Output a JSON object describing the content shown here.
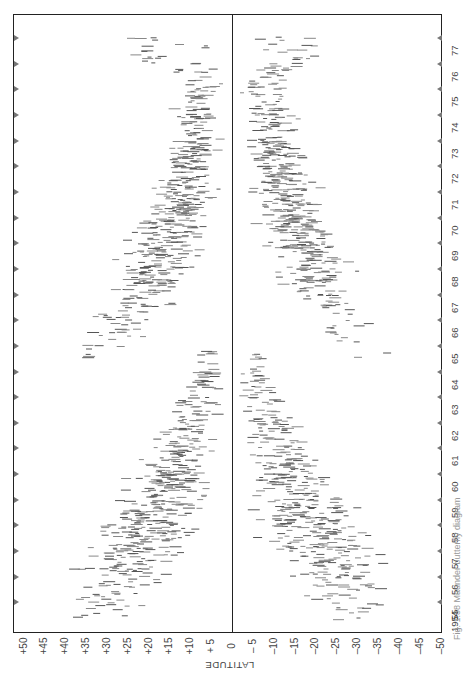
{
  "chart_data": {
    "type": "scatter",
    "title": "",
    "subtitle": "Butterfly diagram of sunspot latitudes (rotated 90°)",
    "xlabel": "LATITUDE",
    "ylabel": "",
    "x_ticks": [
      "+50",
      "+45",
      "+40",
      "+35",
      "+30",
      "+25",
      "+20",
      "+15",
      "+10",
      "+5",
      "0",
      "-5",
      "-10",
      "-15",
      "-20",
      "-25",
      "-30",
      "-35",
      "-40",
      "-45",
      "-50"
    ],
    "x_tick_values": [
      50,
      45,
      40,
      35,
      30,
      25,
      20,
      15,
      10,
      5,
      0,
      -5,
      -10,
      -15,
      -20,
      -25,
      -30,
      -35,
      -40,
      -45,
      -50
    ],
    "xlim": [
      50,
      -50
    ],
    "y_ticks": [
      "1954",
      "55",
      "56",
      "57",
      "58",
      "59",
      "60",
      "61",
      "62",
      "63",
      "64",
      "65",
      "66",
      "67",
      "68",
      "69",
      "70",
      "71",
      "72",
      "73",
      "74",
      "75",
      "76",
      "77"
    ],
    "ylim": [
      1954,
      1977
    ],
    "grid": false,
    "reference_line": {
      "latitude": 0
    },
    "series": [
      {
        "name": "Northern hemisphere (cycle 19)",
        "points": [
          {
            "year": 1954.3,
            "lat_min": 22,
            "lat_max": 40,
            "density": 0.15
          },
          {
            "year": 1955.0,
            "lat_min": 14,
            "lat_max": 45,
            "density": 0.35
          },
          {
            "year": 1956.0,
            "lat_min": 10,
            "lat_max": 42,
            "density": 0.75
          },
          {
            "year": 1957.0,
            "lat_min": 6,
            "lat_max": 40,
            "density": 0.95
          },
          {
            "year": 1958.0,
            "lat_min": 4,
            "lat_max": 36,
            "density": 1.0
          },
          {
            "year": 1959.0,
            "lat_min": 3,
            "lat_max": 32,
            "density": 0.9
          },
          {
            "year": 1960.0,
            "lat_min": 2,
            "lat_max": 27,
            "density": 0.7
          },
          {
            "year": 1961.0,
            "lat_min": 2,
            "lat_max": 22,
            "density": 0.5
          },
          {
            "year": 1962.0,
            "lat_min": 1,
            "lat_max": 18,
            "density": 0.4
          },
          {
            "year": 1963.0,
            "lat_min": 1,
            "lat_max": 15,
            "density": 0.3
          },
          {
            "year": 1964.0,
            "lat_min": 1,
            "lat_max": 10,
            "density": 0.12
          }
        ]
      },
      {
        "name": "Southern hemisphere (cycle 19)",
        "points": [
          {
            "year": 1954.3,
            "lat_min": -38,
            "lat_max": -22,
            "density": 0.15
          },
          {
            "year": 1955.0,
            "lat_min": -44,
            "lat_max": -14,
            "density": 0.35
          },
          {
            "year": 1956.0,
            "lat_min": -42,
            "lat_max": -10,
            "density": 0.7
          },
          {
            "year": 1957.0,
            "lat_min": -40,
            "lat_max": -5,
            "density": 0.95
          },
          {
            "year": 1958.0,
            "lat_min": -35,
            "lat_max": -3,
            "density": 1.0
          },
          {
            "year": 1959.0,
            "lat_min": -30,
            "lat_max": -2,
            "density": 0.8
          },
          {
            "year": 1960.0,
            "lat_min": -26,
            "lat_max": -2,
            "density": 0.6
          },
          {
            "year": 1961.0,
            "lat_min": -22,
            "lat_max": -2,
            "density": 0.45
          },
          {
            "year": 1962.0,
            "lat_min": -18,
            "lat_max": -1,
            "density": 0.35
          },
          {
            "year": 1963.0,
            "lat_min": -14,
            "lat_max": -1,
            "density": 0.25
          },
          {
            "year": 1964.0,
            "lat_min": -10,
            "lat_max": -1,
            "density": 0.12
          }
        ]
      },
      {
        "name": "Northern hemisphere (cycle 20)",
        "points": [
          {
            "year": 1964.5,
            "lat_min": 25,
            "lat_max": 42,
            "density": 0.15
          },
          {
            "year": 1965.5,
            "lat_min": 18,
            "lat_max": 40,
            "density": 0.35
          },
          {
            "year": 1966.5,
            "lat_min": 12,
            "lat_max": 36,
            "density": 0.55
          },
          {
            "year": 1967.5,
            "lat_min": 8,
            "lat_max": 32,
            "density": 0.75
          },
          {
            "year": 1968.5,
            "lat_min": 5,
            "lat_max": 30,
            "density": 0.85
          },
          {
            "year": 1969.5,
            "lat_min": 3,
            "lat_max": 26,
            "density": 0.9
          },
          {
            "year": 1970.5,
            "lat_min": 2,
            "lat_max": 24,
            "density": 0.8
          },
          {
            "year": 1971.5,
            "lat_min": 2,
            "lat_max": 20,
            "density": 0.6
          },
          {
            "year": 1972.5,
            "lat_min": 1,
            "lat_max": 18,
            "density": 0.5
          },
          {
            "year": 1973.5,
            "lat_min": 1,
            "lat_max": 16,
            "density": 0.4
          },
          {
            "year": 1974.5,
            "lat_min": 1,
            "lat_max": 14,
            "density": 0.35
          },
          {
            "year": 1975.5,
            "lat_min": 1,
            "lat_max": 12,
            "density": 0.2
          },
          {
            "year": 1976.3,
            "lat_min": 1,
            "lat_max": 30,
            "density": 0.15
          }
        ]
      },
      {
        "name": "Southern hemisphere (cycle 20)",
        "points": [
          {
            "year": 1964.5,
            "lat_min": -40,
            "lat_max": -22,
            "density": 0.1
          },
          {
            "year": 1965.5,
            "lat_min": -36,
            "lat_max": -18,
            "density": 0.15
          },
          {
            "year": 1966.5,
            "lat_min": -34,
            "lat_max": -14,
            "density": 0.4
          },
          {
            "year": 1967.5,
            "lat_min": -32,
            "lat_max": -10,
            "density": 0.7
          },
          {
            "year": 1968.5,
            "lat_min": -30,
            "lat_max": -6,
            "density": 0.85
          },
          {
            "year": 1969.5,
            "lat_min": -26,
            "lat_max": -4,
            "density": 0.9
          },
          {
            "year": 1970.5,
            "lat_min": -24,
            "lat_max": -3,
            "density": 0.85
          },
          {
            "year": 1971.5,
            "lat_min": -22,
            "lat_max": -2,
            "density": 0.75
          },
          {
            "year": 1972.5,
            "lat_min": -20,
            "lat_max": -2,
            "density": 0.6
          },
          {
            "year": 1973.5,
            "lat_min": -18,
            "lat_max": -1,
            "density": 0.45
          },
          {
            "year": 1974.5,
            "lat_min": -16,
            "lat_max": -1,
            "density": 0.35
          },
          {
            "year": 1975.5,
            "lat_min": -14,
            "lat_max": -1,
            "density": 0.25
          },
          {
            "year": 1976.3,
            "lat_min": -28,
            "lat_max": -1,
            "density": 0.15
          }
        ]
      }
    ],
    "annotations": [
      "Solar cycle minimum ~1964–65 with new-cycle spots at high latitude",
      "Solar cycle minimum ~1976"
    ]
  },
  "axis": {
    "title": "LATITUDE",
    "x_labels": [
      "+50",
      "+45",
      "+40",
      "+35",
      "+30",
      "+25",
      "+20",
      "+15",
      "+10",
      "+ 5",
      "0",
      "– 5",
      "–10",
      "–15",
      "–20",
      "–25",
      "–30",
      "–35",
      "–40",
      "–45",
      "–50"
    ],
    "year_labels": [
      "1954",
      "55",
      "56",
      "57",
      "58",
      "59",
      "60",
      "61",
      "62",
      "63",
      "64",
      "65",
      "66",
      "67",
      "68",
      "69",
      "70",
      "71",
      "72",
      "73",
      "74",
      "75",
      "76",
      "77"
    ]
  },
  "caption": "Fig. 1.38  Maunder butterfly diagram"
}
